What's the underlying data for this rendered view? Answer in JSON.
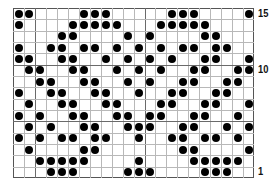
{
  "chart_data": {
    "type": "table",
    "title": "",
    "columns": 22,
    "rows": 15,
    "row_labels": [
      {
        "row": 15,
        "label": "15"
      },
      {
        "row": 10,
        "label": "10"
      },
      {
        "row": 1,
        "label": "1"
      }
    ],
    "dot_color": "#000000",
    "grid_color": "#b8b8b8",
    "cells_filled_by_row": {
      "15": [
        0,
        1,
        6,
        7,
        8,
        14,
        15,
        16,
        21
      ],
      "14": [
        0,
        5,
        6,
        7,
        8,
        9,
        13,
        14,
        15,
        16,
        17
      ],
      "13": [
        4,
        5,
        10,
        12,
        17,
        18
      ],
      "12": [
        0,
        3,
        4,
        6,
        7,
        9,
        11,
        13,
        15,
        16,
        18,
        19
      ],
      "11": [
        0,
        1,
        4,
        5,
        8,
        10,
        12,
        14,
        17,
        18,
        21
      ],
      "10": [
        1,
        2,
        5,
        6,
        9,
        11,
        13,
        16,
        17,
        20,
        21
      ],
      "9": [
        2,
        3,
        6,
        7,
        10,
        12,
        15,
        16,
        19,
        20
      ],
      "8": [
        0,
        3,
        4,
        7,
        8,
        11,
        14,
        15,
        18,
        19
      ],
      "7": [
        1,
        4,
        5,
        8,
        9,
        13,
        14,
        17,
        18,
        21
      ],
      "6": [
        0,
        2,
        5,
        6,
        9,
        10,
        12,
        13,
        16,
        17,
        20
      ],
      "5": [
        1,
        3,
        6,
        7,
        10,
        11,
        12,
        15,
        16,
        19,
        21
      ],
      "4": [
        0,
        2,
        4,
        5,
        7,
        8,
        11,
        14,
        15,
        17,
        18,
        20
      ],
      "3": [
        1,
        6,
        7,
        15,
        16,
        21
      ],
      "2": [
        2,
        3,
        4,
        5,
        6,
        11,
        16,
        17,
        18,
        19,
        20
      ],
      "1": [
        3,
        4,
        5,
        10,
        11,
        12,
        17,
        18,
        19
      ]
    }
  },
  "labels": {
    "row15": "15",
    "row10": "10",
    "row1": "1"
  }
}
